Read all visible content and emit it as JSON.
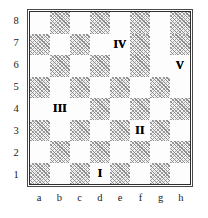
{
  "figure": {
    "board_size": 8,
    "colors": {
      "light_square": "#fdfdfd",
      "dark_square_hatch": "#8d8d8d",
      "border_outer": "#4a4a4a",
      "border_inner": "#2e2e2e",
      "label_text": "#1a1a1a",
      "marker_text": "#000000"
    }
  },
  "axes": {
    "ranks": [
      "8",
      "7",
      "6",
      "5",
      "4",
      "3",
      "2",
      "1"
    ],
    "files": [
      "a",
      "b",
      "c",
      "d",
      "e",
      "f",
      "g",
      "h"
    ]
  },
  "squares": {
    "rank_8": [
      "light",
      "dark",
      "light",
      "dark",
      "light",
      "dark",
      "light",
      "dark"
    ],
    "rank_7": [
      "dark",
      "light",
      "dark",
      "light",
      "light",
      "dark",
      "light",
      "dark"
    ],
    "rank_6": [
      "light",
      "dark",
      "light",
      "dark",
      "light",
      "dark",
      "light",
      "light"
    ],
    "rank_5": [
      "dark",
      "light",
      "dark",
      "light",
      "dark",
      "light",
      "dark",
      "light"
    ],
    "rank_4": [
      "light",
      "light",
      "light",
      "dark",
      "light",
      "dark",
      "light",
      "dark"
    ],
    "rank_3": [
      "dark",
      "light",
      "dark",
      "light",
      "dark",
      "light",
      "dark",
      "light"
    ],
    "rank_2": [
      "light",
      "dark",
      "light",
      "dark",
      "light",
      "dark",
      "light",
      "dark"
    ],
    "rank_1": [
      "dark",
      "light",
      "dark",
      "light",
      "dark",
      "light",
      "dark",
      "light"
    ]
  },
  "markers": [
    {
      "label": "I",
      "file": "d",
      "rank": "1",
      "square": "d1"
    },
    {
      "label": "II",
      "file": "f",
      "rank": "3",
      "square": "f3"
    },
    {
      "label": "III",
      "file": "b",
      "rank": "4",
      "square": "b4"
    },
    {
      "label": "IV",
      "file": "e",
      "rank": "7",
      "square": "e7"
    },
    {
      "label": "V",
      "file": "h",
      "rank": "6",
      "square": "h6"
    }
  ],
  "marker_lookup": {
    "d1": "I",
    "f3": "II",
    "b4": "III",
    "e7": "IV",
    "h6": "V"
  }
}
